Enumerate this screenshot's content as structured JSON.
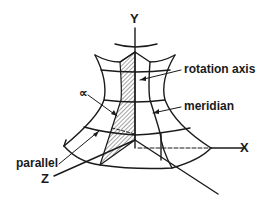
{
  "figure": {
    "type": "surface-of-revolution diagram",
    "axes": {
      "y": "Y",
      "x": "X",
      "z": "Z"
    },
    "labels": {
      "rotation_axis": "rotation axis",
      "meridian": "meridian",
      "parallel": "parallel",
      "angle": "∝"
    },
    "colors": {
      "line": "#1a1a1a",
      "background": "#ffffff"
    }
  }
}
